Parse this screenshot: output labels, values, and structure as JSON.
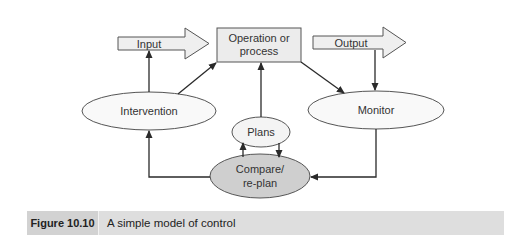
{
  "diagram": {
    "nodes": {
      "input": "Input",
      "operation_line1": "Operation or",
      "operation_line2": "process",
      "output": "Output",
      "intervention": "Intervention",
      "monitor": "Monitor",
      "plans": "Plans",
      "compare_line1": "Compare/",
      "compare_line2": "re-plan"
    },
    "edges": [
      {
        "from": "intervention",
        "to": "input"
      },
      {
        "from": "intervention",
        "to": "operation"
      },
      {
        "from": "operation",
        "to": "monitor"
      },
      {
        "from": "output",
        "to": "monitor"
      },
      {
        "from": "plans",
        "to": "operation"
      },
      {
        "from": "compare",
        "to": "plans"
      },
      {
        "from": "plans",
        "to": "compare"
      },
      {
        "from": "monitor",
        "to": "compare"
      },
      {
        "from": "compare",
        "to": "intervention"
      }
    ]
  },
  "caption": {
    "figure_label": "Figure 10.10",
    "title": "A simple model of control"
  },
  "colors": {
    "panel_bg": "#e9e9e9",
    "shape_fill": "#efefef",
    "ellipse_fill": "#f9f9f9",
    "compare_fill": "#cfcfcf",
    "stroke": "#3a3a3a",
    "caption_bg": "#dedede",
    "caption_label_bg": "#d2d2d2"
  }
}
